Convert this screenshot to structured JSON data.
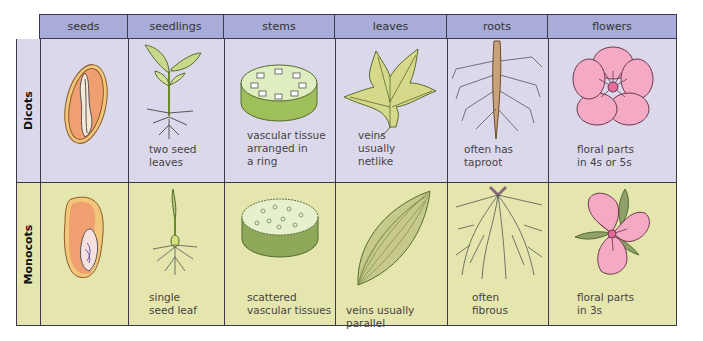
{
  "columns": [
    "seeds",
    "seedlings",
    "stems",
    "leaves",
    "roots",
    "flowers"
  ],
  "rows": [
    {
      "label": "Dicots",
      "captions": {
        "seeds": "",
        "seedlings": "two seed\nleaves",
        "stems": "vascular tissue\narranged in\na ring",
        "leaves": "veins\nusually\nnetlike",
        "roots": "often has\ntaproot",
        "flowers": "floral parts\nin 4s or 5s"
      }
    },
    {
      "label": "Monocots",
      "captions": {
        "seeds": "",
        "seedlings": "single\nseed leaf",
        "stems": "scattered\nvascular tissues",
        "leaves": "veins usually parallel",
        "roots": "often\nfibrous",
        "flowers": "floral parts\nin 3s"
      }
    }
  ],
  "colors": {
    "header": "#a9acd8",
    "dicot_row": "#dcd8ec",
    "monocot_row": "#e4e6ae",
    "border": "#3a3a4a"
  }
}
